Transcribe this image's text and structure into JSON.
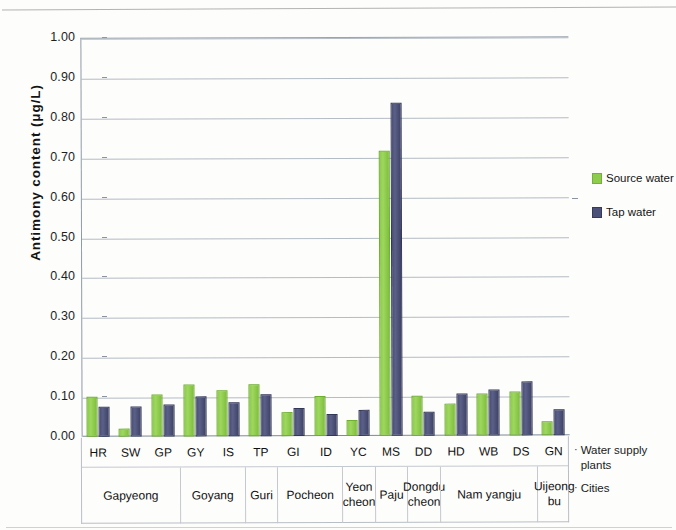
{
  "chart_data": {
    "type": "bar",
    "title": "",
    "xlabel": "",
    "ylabel": "Antimony content (μg/L)",
    "ylim": [
      0,
      1.0
    ],
    "ytick_labels": [
      "1.00",
      "0.90",
      "0.80",
      "0.70",
      "0.60",
      "0.50",
      "0.40",
      "0.30",
      "0.20",
      "0.10",
      "0.00"
    ],
    "ytick_values": [
      1.0,
      0.9,
      0.8,
      0.7,
      0.6,
      0.5,
      0.4,
      0.3,
      0.2,
      0.1,
      0.0
    ],
    "grid": true,
    "legend_position": "right",
    "categories": [
      "HR",
      "SW",
      "GP",
      "GY",
      "IS",
      "TP",
      "GI",
      "ID",
      "YC",
      "MS",
      "DD",
      "HD",
      "WB",
      "DS",
      "GN"
    ],
    "series": [
      {
        "name": "Source water",
        "color": "#8dcc4c",
        "values": [
          0.1,
          0.02,
          0.105,
          0.13,
          0.115,
          0.13,
          0.06,
          0.1,
          0.04,
          0.715,
          0.1,
          0.08,
          0.105,
          0.11,
          0.035
        ]
      },
      {
        "name": "Tap water",
        "color": "#4c5179",
        "values": [
          0.075,
          0.075,
          0.08,
          0.1,
          0.085,
          0.105,
          0.07,
          0.055,
          0.065,
          0.835,
          0.06,
          0.105,
          0.115,
          0.135,
          0.065
        ]
      }
    ],
    "row_headers": {
      "plants": "Water supply plants",
      "cities": "Cities"
    },
    "cities": [
      {
        "name": "Gapyeong",
        "plants": [
          "HR",
          "SW",
          "GP"
        ]
      },
      {
        "name": "Goyang",
        "plants": [
          "GY",
          "IS"
        ]
      },
      {
        "name": "Guri",
        "plants": [
          "TP"
        ]
      },
      {
        "name": "Pocheon",
        "plants": [
          "GI",
          "ID"
        ]
      },
      {
        "name": "Yeon cheon",
        "plants": [
          "YC"
        ]
      },
      {
        "name": "Paju",
        "plants": [
          "MS"
        ]
      },
      {
        "name": "Dongdu cheon",
        "plants": [
          "DD"
        ]
      },
      {
        "name": "Nam yangju",
        "plants": [
          "HD",
          "WB",
          "DS"
        ]
      },
      {
        "name": "Uijeong bu",
        "plants": [
          "GN"
        ]
      }
    ]
  },
  "legend": {
    "items": [
      {
        "label": "Source water"
      },
      {
        "label": "Tap water"
      }
    ]
  },
  "captions": {
    "bullet": "·",
    "plants": "Water supply plants",
    "cities": "Cities"
  }
}
